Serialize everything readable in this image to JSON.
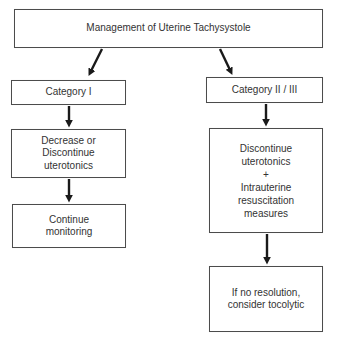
{
  "flowchart": {
    "title": "Management of Uterine Tachysystole",
    "left_branch": {
      "category_label": "Category I",
      "step1_label": "Decrease or\nDiscontinue\nuterotonics",
      "step2_label": "Continue\nmonitoring"
    },
    "right_branch": {
      "category_label": "Category II / III",
      "step1_label": "Discontinue\nuterotonics\n+\nIntrauterine\nresuscitation\nmeasures",
      "step2_label": "If no resolution,\nconsider tocolytic"
    },
    "colors": {
      "box_border": "#4c4c4c",
      "text": "#333333",
      "arrow": "#1a1a1a",
      "background": "#ffffff"
    }
  }
}
